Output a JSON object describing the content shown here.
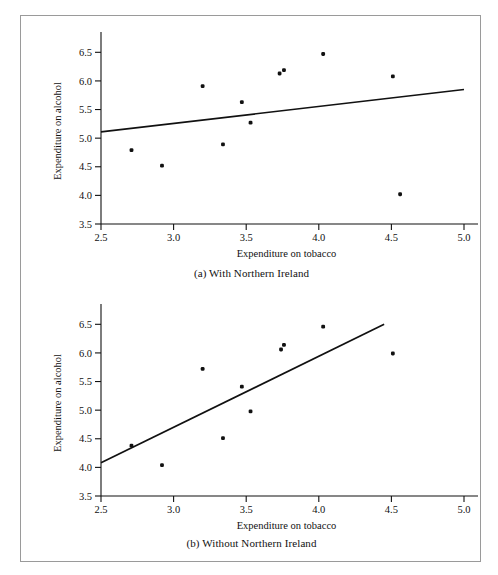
{
  "figure": {
    "border_color": "#9a9a9a",
    "background": "#ffffff",
    "ink_color": "#111111"
  },
  "panels": [
    {
      "id": "a",
      "caption": "(a) With Northern Ireland",
      "xlabel": "Expenditure on tobacco",
      "ylabel": "Expenditure on alcohol"
    },
    {
      "id": "b",
      "caption": "(b) Without Northern Ireland",
      "xlabel": "Expenditure on tobacco",
      "ylabel": "Expenditure on alcohol"
    }
  ],
  "chart_data": [
    {
      "type": "scatter",
      "title": "(a) With Northern Ireland",
      "xlabel": "Expenditure on tobacco",
      "ylabel": "Expenditure on alcohol",
      "xlim": [
        2.5,
        5.0
      ],
      "ylim": [
        3.5,
        6.75
      ],
      "xticks": [
        2.5,
        3.0,
        3.5,
        4.0,
        4.5,
        5.0
      ],
      "xtick_labels": [
        "2.5",
        "3.0",
        "3.5",
        "4.0",
        "4.5",
        "5.0"
      ],
      "yticks": [
        3.5,
        4.0,
        4.5,
        5.0,
        5.5,
        6.0,
        6.5
      ],
      "ytick_labels": [
        "3.5",
        "4.0",
        "4.5",
        "5.0",
        "5.5",
        "6.0",
        "6.5"
      ],
      "grid": false,
      "legend": null,
      "points": [
        {
          "x": 2.71,
          "y": 4.79
        },
        {
          "x": 2.92,
          "y": 4.52
        },
        {
          "x": 3.2,
          "y": 5.91
        },
        {
          "x": 3.34,
          "y": 4.89
        },
        {
          "x": 3.47,
          "y": 5.63
        },
        {
          "x": 3.53,
          "y": 5.27
        },
        {
          "x": 3.73,
          "y": 6.13
        },
        {
          "x": 3.76,
          "y": 6.19
        },
        {
          "x": 4.03,
          "y": 6.47
        },
        {
          "x": 4.51,
          "y": 6.08
        },
        {
          "x": 4.56,
          "y": 4.02
        }
      ],
      "fit_line": {
        "type": "linear-regression",
        "x_start": 2.5,
        "y_start": 5.11,
        "x_end": 5.0,
        "y_end": 5.85
      }
    },
    {
      "type": "scatter",
      "title": "(b) Without Northern Ireland",
      "xlabel": "Expenditure on tobacco",
      "ylabel": "Expenditure on alcohol",
      "xlim": [
        2.5,
        5.0
      ],
      "ylim": [
        3.5,
        6.75
      ],
      "xticks": [
        2.5,
        3.0,
        3.5,
        4.0,
        4.5,
        5.0
      ],
      "xtick_labels": [
        "2.5",
        "3.0",
        "3.5",
        "4.0",
        "4.5",
        "5.0"
      ],
      "yticks": [
        3.5,
        4.0,
        4.5,
        5.0,
        5.5,
        6.0,
        6.5
      ],
      "ytick_labels": [
        "3.5",
        "4.0",
        "4.5",
        "5.0",
        "5.5",
        "6.0",
        "6.5"
      ],
      "grid": false,
      "legend": null,
      "points": [
        {
          "x": 2.71,
          "y": 4.38
        },
        {
          "x": 2.92,
          "y": 4.04
        },
        {
          "x": 3.2,
          "y": 5.72
        },
        {
          "x": 3.34,
          "y": 4.51
        },
        {
          "x": 3.47,
          "y": 5.41
        },
        {
          "x": 3.53,
          "y": 4.98
        },
        {
          "x": 3.74,
          "y": 6.06
        },
        {
          "x": 3.76,
          "y": 6.14
        },
        {
          "x": 4.03,
          "y": 6.46
        },
        {
          "x": 4.51,
          "y": 5.99
        }
      ],
      "fit_line": {
        "type": "linear-regression",
        "x_start": 2.5,
        "y_start": 4.08,
        "x_end": 4.45,
        "y_end": 6.5
      }
    }
  ]
}
